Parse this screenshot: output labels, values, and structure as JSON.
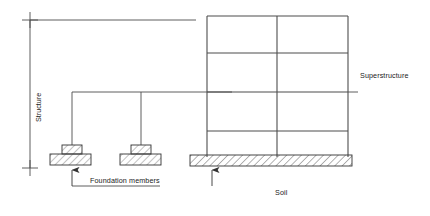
{
  "diagram": {
    "labels": {
      "structure": "Structure",
      "superstructure": "Superstructure",
      "foundation_members": "Foundation members",
      "soil": "Soil"
    },
    "colors": {
      "line": "#4d4d4d",
      "line_dark": "#333333",
      "hatch": "#666666",
      "text": "#1a1a1a",
      "background": "#ffffff"
    },
    "frame": {
      "name": "superstructure-frame",
      "bays": 2,
      "stories": 4,
      "column_x": [
        207,
        277,
        348
      ],
      "beam_y": [
        16,
        53,
        92,
        131,
        155
      ],
      "left": 207,
      "right": 348,
      "top": 16,
      "bottom": 155
    },
    "soil_strip": {
      "name": "soil-strip",
      "x": 190,
      "y": 155,
      "width": 162,
      "height": 11,
      "hatch": "diagonal"
    },
    "footings": [
      {
        "name": "footing-left",
        "cap_x": 62,
        "cap_y": 145,
        "cap_w": 20,
        "cap_h": 9,
        "base_x": 50,
        "base_y": 154,
        "base_w": 41,
        "base_h": 11,
        "column_x": 72
      },
      {
        "name": "footing-right",
        "cap_x": 131,
        "cap_y": 145,
        "cap_w": 20,
        "cap_h": 9,
        "base_x": 120,
        "base_y": 154,
        "base_w": 41,
        "base_h": 11,
        "column_x": 141
      }
    ],
    "leader_lines": {
      "structure_dim_x": 30,
      "structure_dim_top": 20,
      "structure_dim_bottom": 168,
      "top_horizontal_y": 20,
      "top_horizontal_x1": 30,
      "top_horizontal_x2": 196,
      "grade_y": 92,
      "grade_x1": 72,
      "grade_x2": 232,
      "callout_y": 186,
      "callout_x1": 72,
      "callout_x2": 160,
      "soil_callout_x": 212,
      "soil_callout_y": 186,
      "superstructure_leader_x1": 348,
      "superstructure_leader_x2": 358,
      "superstructure_leader_y": 92
    },
    "label_positions": {
      "structure": {
        "x": 34,
        "y": 122
      },
      "superstructure": {
        "x": 360,
        "y": 75
      },
      "foundation_members": {
        "x": 90,
        "y": 180
      },
      "soil": {
        "x": 275,
        "y": 192
      }
    }
  }
}
